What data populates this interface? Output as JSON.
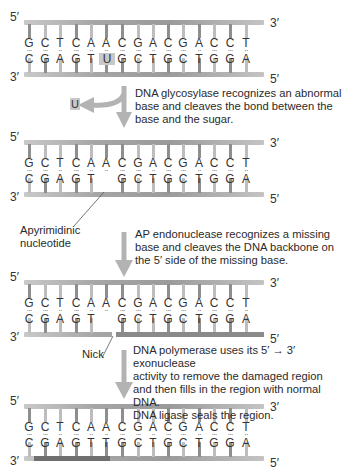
{
  "figure": {
    "strand_labels": {
      "top_left": "5′",
      "top_right": "3′",
      "bottom_left": "3′",
      "bottom_right": "5′"
    },
    "colors": {
      "backbone": "#a6a6a6",
      "rung_dark": "#8e8e8e",
      "rung_light": "#bdbdbd",
      "uracil_highlight": "#c8c8c8",
      "arrow": "#b3b3b3",
      "repaired_segment": "#6f6f6f"
    }
  },
  "helices": [
    {
      "id": "original",
      "top": [
        "G",
        "C",
        "T",
        "C",
        "A",
        "A",
        "C",
        "G",
        "A",
        "C",
        "G",
        "A",
        "C",
        "C",
        "T"
      ],
      "bottom": [
        "C",
        "G",
        "A",
        "G",
        "T",
        "U",
        "G",
        "C",
        "T",
        "G",
        "C",
        "T",
        "G",
        "G",
        "A"
      ],
      "highlight_index": 5
    },
    {
      "id": "apyrimidinic",
      "top": [
        "G",
        "C",
        "T",
        "C",
        "A",
        "A",
        "C",
        "G",
        "A",
        "C",
        "G",
        "A",
        "C",
        "C",
        "T"
      ],
      "bottom": [
        "C",
        "G",
        "A",
        "G",
        "T",
        "",
        "G",
        "C",
        "T",
        "G",
        "C",
        "T",
        "G",
        "G",
        "A"
      ]
    },
    {
      "id": "nicked",
      "top": [
        "G",
        "C",
        "T",
        "C",
        "A",
        "A",
        "C",
        "G",
        "A",
        "C",
        "G",
        "A",
        "C",
        "C",
        "T"
      ],
      "bottom": [
        "C",
        "G",
        "A",
        "G",
        "T",
        "",
        "G",
        "C",
        "T",
        "G",
        "C",
        "T",
        "G",
        "G",
        "A"
      ]
    },
    {
      "id": "repaired",
      "top": [
        "G",
        "C",
        "T",
        "C",
        "A",
        "A",
        "C",
        "G",
        "A",
        "C",
        "G",
        "A",
        "C",
        "C",
        "T"
      ],
      "bottom": [
        "C",
        "G",
        "A",
        "G",
        "T",
        "T",
        "G",
        "C",
        "T",
        "G",
        "C",
        "T",
        "G",
        "G",
        "A"
      ]
    }
  ],
  "steps": [
    {
      "text_lines": [
        "DNA glycosylase recognizes an abnormal",
        "base and cleaves the bond between the",
        "base and the sugar."
      ],
      "removed_base": "U"
    },
    {
      "text_lines": [
        "AP endonuclease recognizes a missing",
        "base and cleaves the DNA backbone on",
        "the 5′ side of the missing base."
      ]
    },
    {
      "text_lines": [
        "DNA polymerase uses its 5′ → 3′ exonuclease",
        "activity to remove the damaged region",
        "and then fills in the region with normal DNA.",
        "DNA ligase seals the region."
      ]
    }
  ],
  "labels": {
    "apyrimidinic": [
      "Apyrimidinic",
      "nucleotide"
    ],
    "nick": "Nick"
  }
}
